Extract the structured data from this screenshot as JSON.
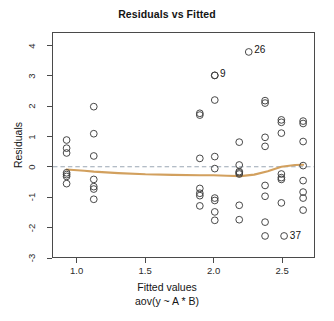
{
  "chart_data": {
    "type": "scatter",
    "title": "Residuals vs Fitted",
    "xlabel": "Fitted values",
    "xsublabel": "aov(y ~ A * B)",
    "ylabel": "Residuals",
    "xlim": [
      0.82,
      2.74
    ],
    "ylim": [
      -3.0,
      4.45
    ],
    "xticks": [
      1.0,
      1.5,
      2.0,
      2.5
    ],
    "xtick_labels": [
      "1.0",
      "1.5",
      "2.0",
      "2.5"
    ],
    "yticks": [
      -3,
      -2,
      -1,
      0,
      1,
      2,
      3,
      4
    ],
    "ytick_labels": [
      "-3",
      "-2",
      "-1",
      "0",
      "1",
      "2",
      "3",
      "4"
    ],
    "grid": false,
    "legend": false,
    "reference_line": {
      "y": 0,
      "style": "dashed",
      "color": "#9aa7b4"
    },
    "smoother": {
      "name": "loess",
      "color": "#d2a05e",
      "x": [
        0.92,
        1.05,
        1.12,
        1.3,
        1.5,
        1.7,
        1.9,
        2.0,
        2.1,
        2.2,
        2.3,
        2.4,
        2.5,
        2.6,
        2.66
      ],
      "y": [
        -0.09,
        -0.13,
        -0.16,
        -0.21,
        -0.25,
        -0.27,
        -0.28,
        -0.28,
        -0.3,
        -0.31,
        -0.26,
        -0.15,
        0.0,
        0.06,
        0.07
      ]
    },
    "marker": {
      "shape": "circle-open",
      "color": "#3d3d3d",
      "size": 3.4
    },
    "points": [
      {
        "x": 0.92,
        "y": 0.89
      },
      {
        "x": 0.92,
        "y": 0.62
      },
      {
        "x": 0.92,
        "y": 0.46
      },
      {
        "x": 0.92,
        "y": -0.2
      },
      {
        "x": 0.92,
        "y": -0.26
      },
      {
        "x": 0.92,
        "y": -0.32
      },
      {
        "x": 0.92,
        "y": -0.56
      },
      {
        "x": 1.12,
        "y": 2.0
      },
      {
        "x": 1.12,
        "y": 1.1
      },
      {
        "x": 1.12,
        "y": 0.36
      },
      {
        "x": 1.12,
        "y": -0.42
      },
      {
        "x": 1.12,
        "y": -0.66
      },
      {
        "x": 1.12,
        "y": -0.74
      },
      {
        "x": 1.12,
        "y": -1.08
      },
      {
        "x": 1.9,
        "y": 1.78
      },
      {
        "x": 1.9,
        "y": 1.72
      },
      {
        "x": 1.9,
        "y": 0.28
      },
      {
        "x": 1.9,
        "y": -0.72
      },
      {
        "x": 1.9,
        "y": -0.88
      },
      {
        "x": 1.9,
        "y": -0.96
      },
      {
        "x": 1.9,
        "y": -1.3
      },
      {
        "x": 2.01,
        "y": 3.04
      },
      {
        "x": 2.01,
        "y": 2.22
      },
      {
        "x": 2.01,
        "y": 0.34
      },
      {
        "x": 2.01,
        "y": -0.06
      },
      {
        "x": 2.01,
        "y": -1.04
      },
      {
        "x": 2.01,
        "y": -1.12
      },
      {
        "x": 2.01,
        "y": -1.5
      },
      {
        "x": 2.01,
        "y": -1.78
      },
      {
        "x": 2.19,
        "y": 0.82
      },
      {
        "x": 2.19,
        "y": 0.06
      },
      {
        "x": 2.19,
        "y": -0.16
      },
      {
        "x": 2.19,
        "y": -0.2
      },
      {
        "x": 2.19,
        "y": -0.24
      },
      {
        "x": 2.19,
        "y": -1.28
      },
      {
        "x": 2.19,
        "y": -1.76
      },
      {
        "x": 2.38,
        "y": 2.2
      },
      {
        "x": 2.38,
        "y": 2.12
      },
      {
        "x": 2.38,
        "y": 0.98
      },
      {
        "x": 2.38,
        "y": 0.68
      },
      {
        "x": 2.38,
        "y": -0.62
      },
      {
        "x": 2.38,
        "y": -0.98
      },
      {
        "x": 2.38,
        "y": -1.84
      },
      {
        "x": 2.38,
        "y": -2.3
      },
      {
        "x": 2.5,
        "y": 1.56
      },
      {
        "x": 2.5,
        "y": 1.48
      },
      {
        "x": 2.5,
        "y": 1.12
      },
      {
        "x": 2.5,
        "y": -0.24
      },
      {
        "x": 2.5,
        "y": -0.36
      },
      {
        "x": 2.5,
        "y": -0.42
      },
      {
        "x": 2.5,
        "y": -1.2
      },
      {
        "x": 2.66,
        "y": 1.52
      },
      {
        "x": 2.66,
        "y": 1.44
      },
      {
        "x": 2.66,
        "y": 0.84
      },
      {
        "x": 2.66,
        "y": 0.04
      },
      {
        "x": 2.66,
        "y": -0.46
      },
      {
        "x": 2.66,
        "y": -0.84
      },
      {
        "x": 2.66,
        "y": -1.04
      },
      {
        "x": 2.66,
        "y": -1.44
      }
    ],
    "labeled_points": [
      {
        "label": "26",
        "x": 2.26,
        "y": 3.82
      },
      {
        "label": "9",
        "x": 2.01,
        "y": 3.04
      },
      {
        "label": "37",
        "x": 2.52,
        "y": -2.3
      }
    ],
    "annotations": [
      "26",
      "9",
      "37"
    ]
  }
}
